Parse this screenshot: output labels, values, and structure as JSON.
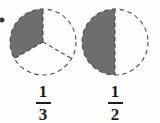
{
  "figure": {
    "background_color": "#fefefe",
    "shade_color": "#6e6e6e",
    "outline_color": "#4a4a4a",
    "text_color": "#1c1c1c",
    "bullet": {
      "icon": "bullet-dot-icon",
      "color": "#3a3a3a",
      "cx": 2,
      "cy": 20,
      "r": 2.5
    },
    "models": [
      {
        "id": "one-third",
        "label_numerator": "1",
        "label_denominator": "3",
        "label_text": "1/3",
        "cx": 43,
        "cy": 42,
        "r": 33,
        "parts_total": 3,
        "parts_shaded": 1,
        "shaded_fraction": 0.3333,
        "sector_start_deg": 90,
        "sector_sweep_deg": 120,
        "divider_angles_deg": [
          90,
          210,
          330
        ],
        "outline_style": "dashed"
      },
      {
        "id": "one-half",
        "label_numerator": "1",
        "label_denominator": "2",
        "label_text": "1/2",
        "cx": 115,
        "cy": 42,
        "r": 33,
        "parts_total": 2,
        "parts_shaded": 1,
        "shaded_fraction": 0.5,
        "sector_start_deg": 90,
        "sector_sweep_deg": 180,
        "divider_angles_deg": [
          90,
          270
        ],
        "outline_style": "dashed"
      }
    ]
  },
  "chart_data": {
    "type": "pie",
    "xlabel": "",
    "ylabel": "",
    "grid": false,
    "legend": "none",
    "charts": [
      {
        "name": "one-third",
        "categories": [
          "shaded",
          "unshaded"
        ],
        "values": [
          1,
          2
        ],
        "slice_fractions": [
          0.3333,
          0.6667
        ],
        "annotation": "1/3"
      },
      {
        "name": "one-half",
        "categories": [
          "shaded",
          "unshaded"
        ],
        "values": [
          1,
          1
        ],
        "slice_fractions": [
          0.5,
          0.5
        ],
        "annotation": "1/2"
      }
    ]
  }
}
